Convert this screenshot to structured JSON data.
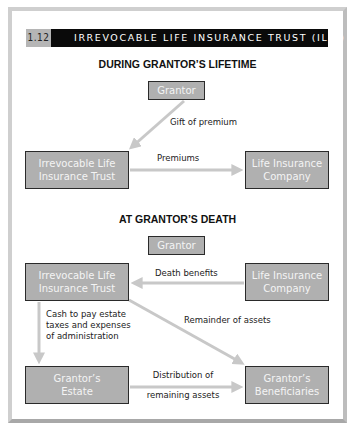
{
  "figure": {
    "number": "1.12",
    "title": "IRREVOCABLE LIFE INSURANCE TRUST (ILIT)"
  },
  "sections": {
    "lifetime": {
      "heading": "DURING GRANTOR’S LIFETIME",
      "nodes": {
        "grantor": "Grantor",
        "ilit_line1": "Irrevocable Life",
        "ilit_line2": "Insurance Trust",
        "insurer_line1": "Life Insurance",
        "insurer_line2": "Company"
      },
      "edges": {
        "gift": "Gift of premium",
        "premiums": "Premiums"
      }
    },
    "death": {
      "heading": "AT GRANTOR’S DEATH",
      "nodes": {
        "grantor": "Grantor",
        "ilit_line1": "Irrevocable Life",
        "ilit_line2": "Insurance Trust",
        "insurer_line1": "Life Insurance",
        "insurer_line2": "Company",
        "estate_line1": "Grantor’s",
        "estate_line2": "Estate",
        "beneficiaries_line1": "Grantor’s",
        "beneficiaries_line2": "Beneficiaries"
      },
      "edges": {
        "death_benefits": "Death benefits",
        "cash_line1": "Cash to pay estate",
        "cash_line2": "taxes and expenses",
        "cash_line3": "of administration",
        "remainder": "Remainder of assets",
        "distribution_line1": "Distribution of",
        "distribution_line2": "remaining assets"
      }
    }
  },
  "colors": {
    "box_fill": "#b0b0b0",
    "box_border": "#2a2a2a",
    "box_text": "#f4f4f4",
    "arrow": "#c8c8c8",
    "title_bar": "#0a0a0a",
    "number_tab": "#b5b5b5"
  }
}
